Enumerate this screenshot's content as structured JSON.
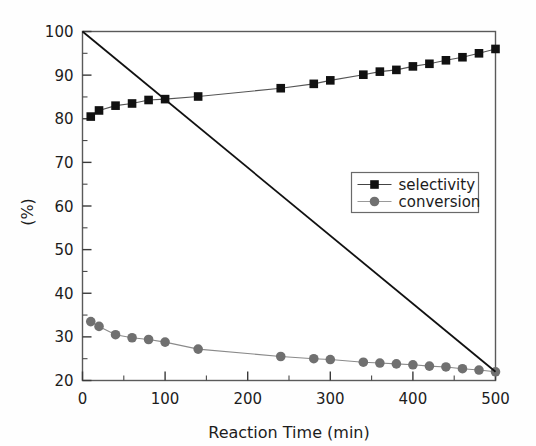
{
  "chart_data": {
    "type": "line",
    "title": "",
    "xlabel": "Reaction Time (min)",
    "ylabel": "(%)",
    "xlim": [
      0,
      500
    ],
    "ylim": [
      20,
      100
    ],
    "xticks": [
      0,
      100,
      200,
      300,
      400,
      500
    ],
    "yticks": [
      20,
      30,
      40,
      50,
      60,
      70,
      80,
      90,
      100
    ],
    "xminor_step": 50,
    "yminor_step": 5,
    "grid": false,
    "legend_position": "upper-right-inside",
    "series": [
      {
        "name": "selectivity",
        "marker": "square",
        "color": "#111111",
        "line_color": "#555555",
        "x": [
          10,
          20,
          40,
          60,
          80,
          100,
          140,
          240,
          280,
          300,
          340,
          360,
          380,
          400,
          420,
          440,
          460,
          480,
          500
        ],
        "values": [
          80.5,
          81.9,
          83.0,
          83.5,
          84.3,
          84.5,
          85.1,
          87.0,
          88.0,
          88.8,
          90.1,
          90.8,
          91.2,
          92.0,
          92.6,
          93.4,
          94.1,
          95.0,
          96.0
        ]
      },
      {
        "name": "conversion",
        "marker": "circle",
        "color": "#707070",
        "line_color": "#8a8a8a",
        "x": [
          10,
          20,
          40,
          60,
          80,
          100,
          140,
          240,
          280,
          300,
          340,
          360,
          380,
          400,
          420,
          440,
          460,
          480,
          500
        ],
        "values": [
          33.5,
          32.4,
          30.5,
          29.8,
          29.4,
          28.8,
          27.2,
          25.5,
          25.0,
          24.8,
          24.2,
          24.0,
          23.8,
          23.6,
          23.3,
          23.1,
          22.7,
          22.4,
          22.0
        ]
      },
      {
        "name": "trend-line",
        "marker": "none",
        "color": "#111111",
        "line_color": "#111111",
        "x": [
          0,
          500
        ],
        "values": [
          100,
          22
        ]
      }
    ],
    "legend_entries": [
      {
        "label": "selectivity",
        "marker": "square",
        "color": "#111111"
      },
      {
        "label": "conversion",
        "marker": "circle",
        "color": "#707070"
      }
    ]
  },
  "axis": {
    "x_tick_labels": [
      "0",
      "100",
      "200",
      "300",
      "400",
      "500"
    ],
    "y_tick_labels": [
      "20",
      "30",
      "40",
      "50",
      "60",
      "70",
      "80",
      "90",
      "100"
    ],
    "x_axis_title": "Reaction Time (min)",
    "y_axis_title": "(%)"
  },
  "legend": {
    "items": [
      {
        "label": "selectivity"
      },
      {
        "label": "conversion"
      }
    ]
  },
  "colors": {
    "selectivity_marker": "#111111",
    "conversion_marker": "#707070",
    "frame": "#5a5a5a",
    "background": "#fefefe",
    "trend_line": "#111111"
  }
}
